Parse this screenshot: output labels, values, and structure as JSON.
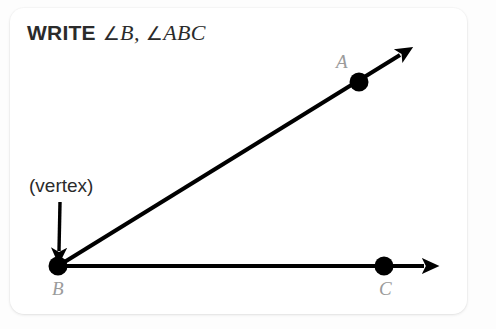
{
  "page": {
    "background_color": "#fdfdfd"
  },
  "card": {
    "background_color": "#ffffff",
    "corner_radius_px": 14
  },
  "heading": {
    "keyword": "WRITE",
    "angle_symbol": "∠",
    "notation_first": "B",
    "separator": ",",
    "notation_second": "ABC",
    "full_text": "WRITE ∠B, ∠ABC",
    "color": "#2b2b2b"
  },
  "callout": {
    "text": "(vertex)",
    "color": "#2b2b2b",
    "arrow": {
      "name": "vertex-pointer-arrow",
      "direction": "down",
      "from_x": 60,
      "from_y": 202,
      "to_x": 59,
      "to_y": 257
    }
  },
  "figure": {
    "stroke_color": "#000000",
    "point_radius_px": 9,
    "ray_width_px": 4,
    "points": [
      {
        "name": "A",
        "label": "A",
        "x": 359,
        "y": 82,
        "label_color": "#9b9b9b"
      },
      {
        "name": "B",
        "label": "B",
        "x": 58,
        "y": 266,
        "label_color": "#9b9b9b"
      },
      {
        "name": "C",
        "label": "C",
        "x": 384,
        "y": 266,
        "label_color": "#9b9b9b"
      }
    ],
    "rays": [
      {
        "name": "ray-BA",
        "from": "B",
        "through": "A",
        "start_x": 58,
        "start_y": 266,
        "end_x": 408,
        "end_y": 50
      },
      {
        "name": "ray-BC",
        "from": "B",
        "through": "C",
        "start_x": 58,
        "start_y": 266,
        "end_x": 432,
        "end_y": 266
      }
    ]
  }
}
